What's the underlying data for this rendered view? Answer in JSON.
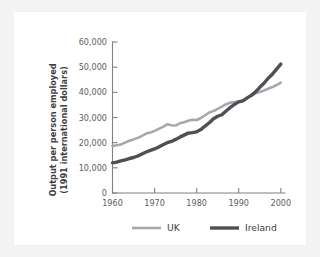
{
  "chart_data": {
    "type": "line",
    "title": "",
    "xlabel": "",
    "ylabel": "Output per person employed (1991 international dollars)",
    "ylabel_line1": "Output per person employed",
    "ylabel_line2": "(1991 international dollars)",
    "xlim": [
      1960,
      2001
    ],
    "ylim": [
      0,
      60000
    ],
    "grid": false,
    "legend_position": "bottom",
    "ytick_labels": [
      "0",
      "10,000",
      "20,000",
      "30,000",
      "40,000",
      "50,000",
      "60,000"
    ],
    "ytick_values": [
      0,
      10000,
      20000,
      30000,
      40000,
      50000,
      60000
    ],
    "xtick_labels": [
      "1960",
      "1970",
      "1980",
      "1990",
      "2000"
    ],
    "xtick_values": [
      1960,
      1970,
      1980,
      1990,
      2000
    ],
    "x": [
      1960,
      1961,
      1962,
      1963,
      1964,
      1965,
      1966,
      1967,
      1968,
      1969,
      1970,
      1971,
      1972,
      1973,
      1974,
      1975,
      1976,
      1977,
      1978,
      1979,
      1980,
      1981,
      1982,
      1983,
      1984,
      1985,
      1986,
      1987,
      1988,
      1989,
      1990,
      1991,
      1992,
      1993,
      1994,
      1995,
      1996,
      1997,
      1998,
      1999,
      2000
    ],
    "series": [
      {
        "name": "UK",
        "color": "#a8a8ac",
        "width": 2.6,
        "values": [
          18700,
          19000,
          19300,
          20000,
          20800,
          21300,
          21900,
          22700,
          23600,
          24000,
          24700,
          25500,
          26300,
          27300,
          26900,
          26800,
          27700,
          28100,
          28700,
          29100,
          29000,
          29800,
          30900,
          32000,
          32600,
          33400,
          34300,
          35300,
          35900,
          36100,
          36400,
          36800,
          37700,
          38700,
          39600,
          40100,
          40700,
          41400,
          42100,
          42900,
          43900
        ]
      },
      {
        "name": "Ireland",
        "color": "#4f4f55",
        "width": 3.4,
        "values": [
          12000,
          12300,
          12800,
          13200,
          13700,
          14100,
          14700,
          15500,
          16300,
          16900,
          17500,
          18300,
          19200,
          20000,
          20500,
          21300,
          22200,
          23000,
          23800,
          24000,
          24300,
          25200,
          26600,
          27900,
          29500,
          30500,
          31100,
          32600,
          34000,
          35200,
          36200,
          36600,
          37800,
          38800,
          40200,
          42000,
          43600,
          45600,
          47200,
          49200,
          51200
        ]
      }
    ],
    "legend": [
      {
        "label": "UK",
        "color": "#a8a8ac",
        "width": 2.6
      },
      {
        "label": "Ireland",
        "color": "#4f4f55",
        "width": 3.4
      }
    ],
    "colors": {
      "background": "#f3f3f3",
      "card": "#ffffff",
      "axis": "#808084",
      "tick_text": "#5c5c60",
      "axis_title": "#3d3d42",
      "uk": "#a8a8ac",
      "ireland": "#4f4f55"
    }
  }
}
